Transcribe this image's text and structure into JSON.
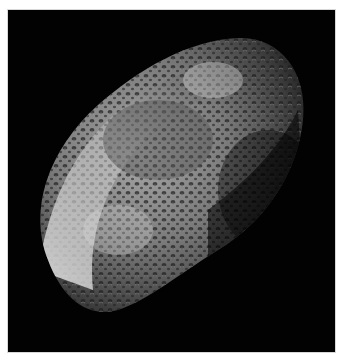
{
  "image": {
    "subject": "cratered sponge-like moon",
    "alt": "Grayscale photograph of an irregular, heavily cratered moon against black space",
    "colors": {
      "background": "#ffffff",
      "space": "#020202",
      "surface_light": "#d9d9d9",
      "surface_mid": "#8a8a8a",
      "surface_dark": "#2a2a2a"
    }
  }
}
